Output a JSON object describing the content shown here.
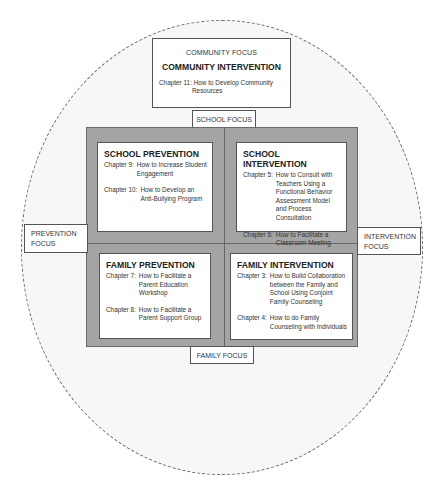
{
  "community": {
    "focus_label": "COMMUNITY FOCUS",
    "title": "COMMUNITY INTERVENTION",
    "chapters": [
      {
        "num": "Chapter 11:",
        "text": "How to Develop Community",
        "text2": "Resources"
      }
    ]
  },
  "axis_labels": {
    "school_focus": "SCHOOL FOCUS",
    "family_focus": "FAMILY FOCUS",
    "prevention_focus_line1": "PREVENTION",
    "prevention_focus_line2": "FOCUS",
    "intervention_focus_line1": "INTERVENTION",
    "intervention_focus_line2": "FOCUS"
  },
  "quadrants": {
    "school_prevention": {
      "title": "SCHOOL PREVENTION",
      "chapters": [
        {
          "num": "Chapter 9:",
          "text": "How to Increase Student Engagement"
        },
        {
          "num": "Chapter 10:",
          "text": "How to Develop an Anti-Bullying Program"
        }
      ]
    },
    "school_intervention": {
      "title": "SCHOOL INTERVENTION",
      "chapters": [
        {
          "num": "Chapter 5:",
          "text": "How to Consult with Teachers Using a Functional Behavior Assessment Model and Process Consultation"
        },
        {
          "num": "Chapter 6:",
          "text": "How to Facilitate a Classroom Meeting"
        }
      ]
    },
    "family_prevention": {
      "title": "FAMILY PREVENTION",
      "chapters": [
        {
          "num": "Chapter 7:",
          "text": "How to Facilitate a Parent Education Workshop"
        },
        {
          "num": "Chapter 8:",
          "text": "How to Facilitate a Parent Support Group"
        }
      ]
    },
    "family_intervention": {
      "title": "FAMILY INTERVENTION",
      "chapters": [
        {
          "num": "Chapter 3:",
          "text": "How to Build Collaboration between the Family and School Using Conjoint Family Counseling"
        },
        {
          "num": "Chapter 4:",
          "text": "How to do Family Counseling with Individuals"
        }
      ]
    }
  },
  "colors": {
    "quadrant_frame": "#a4a4a4",
    "ellipse_fill": "#f7f7f7",
    "ellipse_border": "#6e6e6e"
  }
}
